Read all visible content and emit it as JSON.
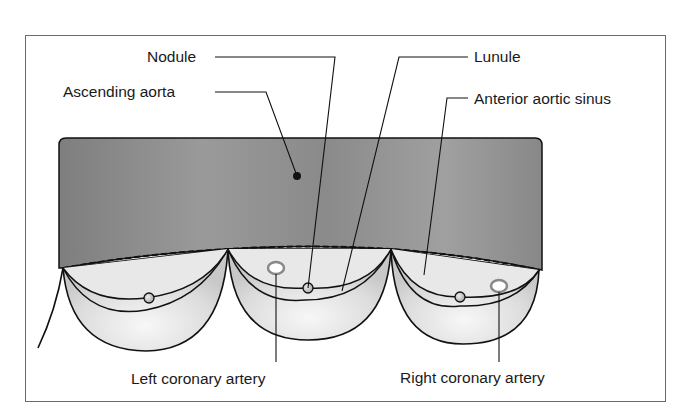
{
  "diagram": {
    "labels": {
      "nodule": "Nodule",
      "ascending_aorta": "Ascending aorta",
      "lunule": "Lunule",
      "anterior_aortic_sinus": "Anterior aortic sinus",
      "left_coronary_artery": "Left coronary artery",
      "right_coronary_artery": "Right coronary artery"
    },
    "colors": {
      "aorta_fill": "#8c8c8c",
      "aorta_fill_light": "#a4a4a4",
      "cusp_fill": "#e4e4e4",
      "outline": "#111111",
      "coronary_ring": "#888888",
      "frame_border": "#6a6a6a"
    }
  }
}
